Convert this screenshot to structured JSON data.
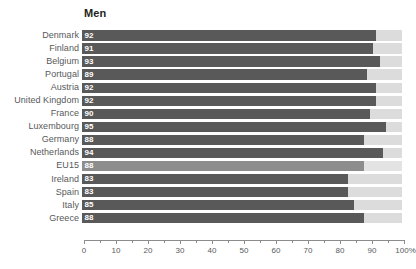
{
  "chart_data": {
    "type": "bar",
    "orientation": "horizontal",
    "title": "Men",
    "xlabel": "",
    "ylabel": "",
    "xlim": [
      0,
      100
    ],
    "grid": false,
    "legend": null,
    "unit": "%",
    "value_labels_inside_bars": true,
    "remainder_shown_to_100": true,
    "categories": [
      "Denmark",
      "Finland",
      "Belgium",
      "Portugal",
      "Austria",
      "United Kingdom",
      "France",
      "Luxembourg",
      "Germany",
      "Netherlands",
      "EU15",
      "Ireland",
      "Spain",
      "Italy",
      "Greece"
    ],
    "values": [
      92,
      91,
      93,
      89,
      92,
      92,
      90,
      95,
      88,
      94,
      88,
      83,
      83,
      85,
      88
    ],
    "highlighted_category": "EU15",
    "xticks": [
      0,
      10,
      20,
      30,
      40,
      50,
      60,
      70,
      80,
      90,
      100
    ],
    "xtick_labels": [
      "0",
      "10",
      "20",
      "30",
      "40",
      "50",
      "60",
      "70",
      "80",
      "90",
      "100%"
    ],
    "minor_xticks": [
      5,
      15,
      25,
      35,
      45,
      55,
      65,
      75,
      85,
      95
    ],
    "colors": {
      "bar_fill": "#595959",
      "bar_fill_highlight": "#8d8d8d",
      "bar_remainder": "#dcdcdc",
      "label_text": "#58595b",
      "value_text": "#ffffff",
      "axis": "#8c8c8c",
      "background": "#ffffff"
    }
  }
}
